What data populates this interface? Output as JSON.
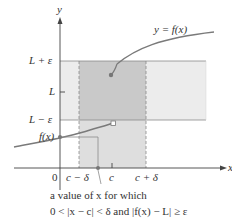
{
  "figure": {
    "curve_label": "y = f(x)",
    "axis_y_label": "y",
    "axis_x_label": "x",
    "y_ticks": {
      "upper": "L + ε",
      "mid": "L",
      "lower": "L − ε",
      "fx": "f(x)"
    },
    "x_ticks": {
      "origin": "0",
      "left": "c − δ",
      "center": "c",
      "right": "c + δ"
    },
    "caption_line1": "a value of x for which",
    "caption_line2": "0 < |x − c| < δ  and |f(x) − L| ≥ ε"
  },
  "colors": {
    "light_band": "#ececec",
    "dark_region": "#c9c9c9",
    "curve": "#7a7a7a",
    "axis": "#444444",
    "dot": "#777777"
  }
}
